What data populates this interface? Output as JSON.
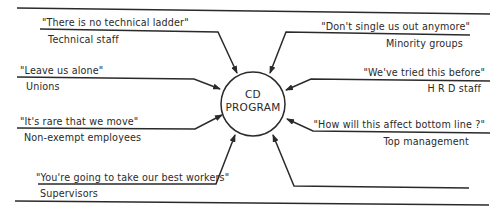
{
  "center": {
    "line1": "CD",
    "line2": "PROGRAM"
  },
  "resistances": [
    {
      "quote": "\"There is no technical ladder\"",
      "group": "Technical staff"
    },
    {
      "quote": "\"Leave us alone\"",
      "group": "Unions"
    },
    {
      "quote": "\"It's rare that we move\"",
      "group": "Non-exempt employees"
    },
    {
      "quote": "\"You're going to take our best workers\"",
      "group": "Supervisors"
    },
    {
      "quote": "\"Don't single us out anymore\"",
      "group": "Minority groups"
    },
    {
      "quote": "\"We've tried this before\"",
      "group": "H R D staff"
    },
    {
      "quote": "\"How will this affect bottom line ?\"",
      "group": "Top management"
    },
    {
      "quote": "",
      "group": ""
    }
  ],
  "colors": {
    "ink": "#2a2a2a",
    "background": "#ffffff"
  }
}
